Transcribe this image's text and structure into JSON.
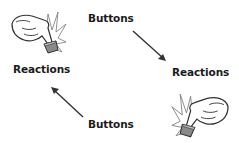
{
  "diagram": {
    "type": "cycle",
    "nodes": [
      {
        "id": "buttons-top",
        "label": "Buttons"
      },
      {
        "id": "reactions-right",
        "label": "Reactions"
      },
      {
        "id": "buttons-bottom",
        "label": "Buttons"
      },
      {
        "id": "reactions-left",
        "label": "Reactions"
      }
    ],
    "edges": [
      {
        "from": "buttons-top",
        "to": "reactions-right",
        "direction": "down-right"
      },
      {
        "from": "buttons-bottom",
        "to": "reactions-left",
        "direction": "up-left"
      }
    ],
    "icons": [
      {
        "name": "hand-pressing-button-icon",
        "position": "top-left"
      },
      {
        "name": "hand-pressing-button-icon",
        "position": "bottom-right",
        "mirrored": true
      }
    ],
    "colors": {
      "text": "#1a1a1a",
      "arrow": "#333333",
      "hand_fill": "#ffffff",
      "hand_stroke": "#333333",
      "button_fill": "#8a8a8a",
      "burst": "#666666"
    }
  }
}
